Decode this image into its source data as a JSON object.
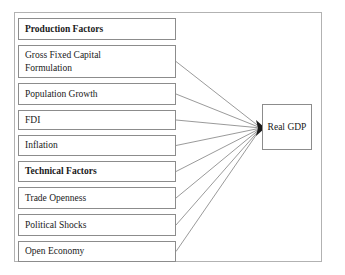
{
  "diagram": {
    "frame": {
      "border_color": "#b2b2b2",
      "background": "#ffffff"
    },
    "line_color": "#808080",
    "box_border_color": "#8c8c8c",
    "text_color": "#1a1a1a",
    "convergence_point": {
      "x": 265,
      "y": 128
    },
    "factors": [
      {
        "label": "Production Factors",
        "bold": true,
        "connected": false,
        "x": 18,
        "y": 18,
        "width": 158,
        "height": 22
      },
      {
        "label": "Gross Fixed Capital\nFormulation",
        "bold": false,
        "connected": true,
        "x": 18,
        "y": 45,
        "width": 158,
        "height": 33
      },
      {
        "label": "Population Growth",
        "bold": false,
        "connected": true,
        "x": 18,
        "y": 83,
        "width": 158,
        "height": 22
      },
      {
        "label": "FDI",
        "bold": false,
        "connected": true,
        "x": 18,
        "y": 110,
        "width": 158,
        "height": 20
      },
      {
        "label": "Inflation",
        "bold": false,
        "connected": true,
        "x": 18,
        "y": 135,
        "width": 158,
        "height": 21
      },
      {
        "label": "Technical Factors",
        "bold": true,
        "connected": true,
        "x": 18,
        "y": 161,
        "width": 158,
        "height": 21
      },
      {
        "label": "Trade Openness",
        "bold": false,
        "connected": true,
        "x": 18,
        "y": 187,
        "width": 158,
        "height": 22
      },
      {
        "label": "Political  Shocks",
        "bold": false,
        "connected": true,
        "x": 18,
        "y": 214,
        "width": 158,
        "height": 22
      },
      {
        "label": "Open Economy",
        "bold": false,
        "connected": true,
        "x": 18,
        "y": 241,
        "width": 158,
        "height": 21
      }
    ],
    "target": {
      "label": "Real GDP",
      "x": 262,
      "y": 104,
      "width": 50,
      "height": 46
    }
  }
}
